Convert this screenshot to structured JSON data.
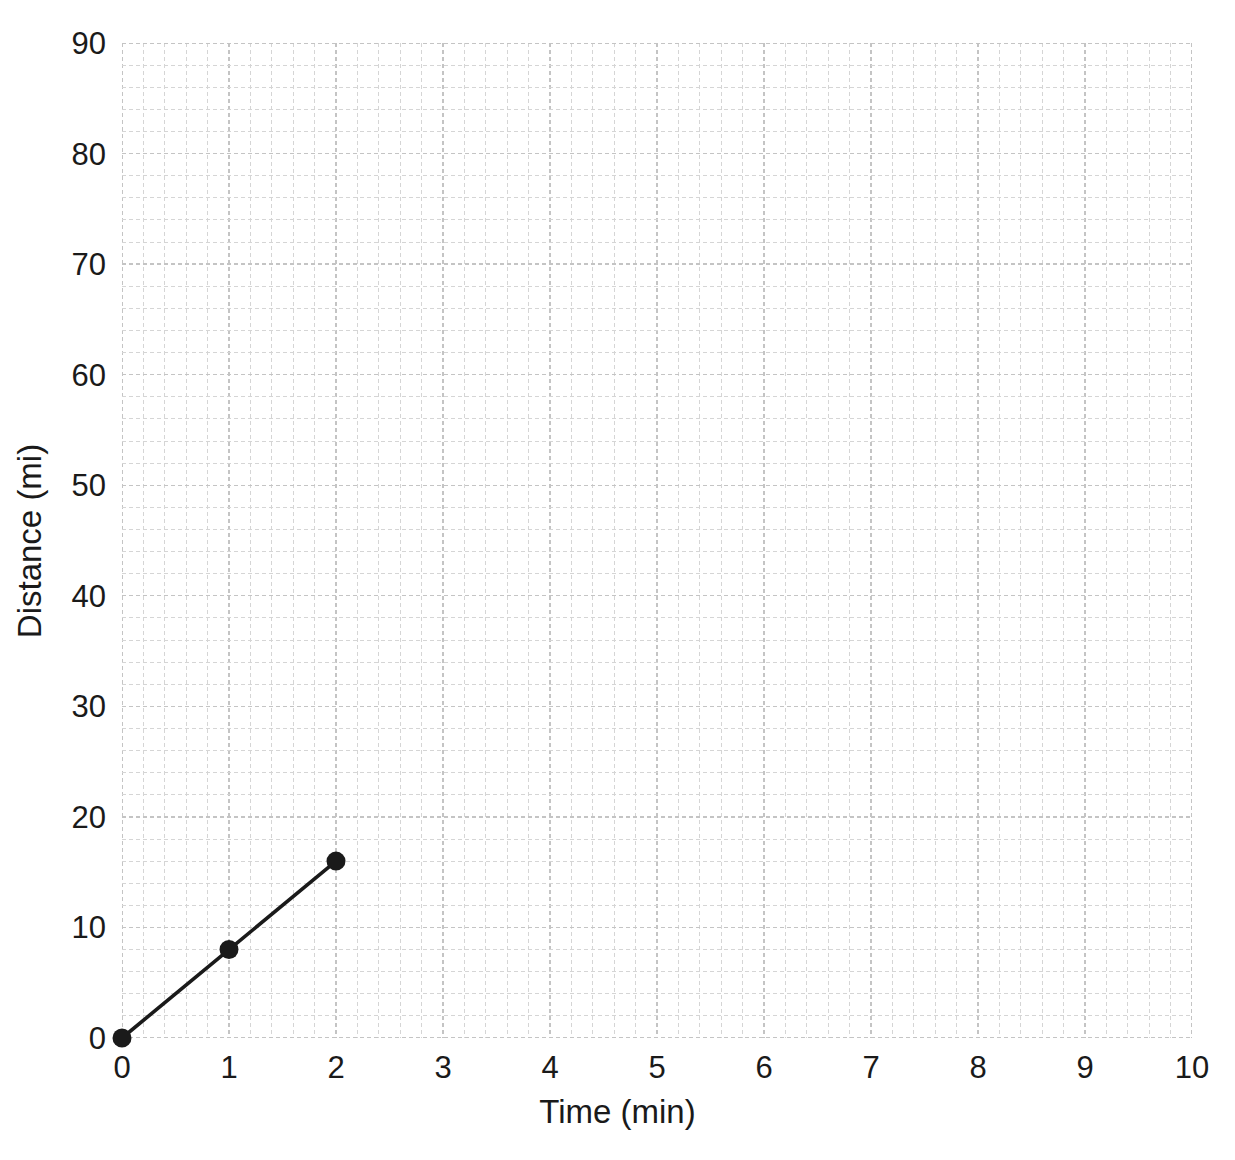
{
  "chart_data": {
    "type": "line",
    "title": "",
    "xlabel": "Time (min)",
    "ylabel": "Distance (mi)",
    "xlim": [
      0,
      10
    ],
    "ylim": [
      0,
      90
    ],
    "xticks": [
      0,
      1,
      2,
      3,
      4,
      5,
      6,
      7,
      8,
      9,
      10
    ],
    "yticks": [
      0,
      10,
      20,
      30,
      40,
      50,
      60,
      70,
      80,
      90
    ],
    "xtick_labels": [
      "0",
      "1",
      "2",
      "3",
      "4",
      "5",
      "6",
      "7",
      "8",
      "9",
      "10"
    ],
    "ytick_labels": [
      "0",
      "10",
      "20",
      "30",
      "40",
      "50",
      "60",
      "70",
      "80",
      "90"
    ],
    "x_minor_step": 0.2,
    "y_minor_step": 2,
    "grid": true,
    "grid_style": "dashed",
    "grid_color": "#d5d5d5",
    "grid_major_color": "#c4c4c4",
    "legend": null,
    "series": [
      {
        "name": "Distance",
        "color": "#1a1a1a",
        "marker": "circle",
        "x": [
          0,
          1,
          2
        ],
        "y": [
          0,
          8,
          16
        ],
        "points": [
          {
            "x": 0,
            "y": 0
          },
          {
            "x": 1,
            "y": 8
          },
          {
            "x": 2,
            "y": 16
          }
        ]
      }
    ]
  },
  "axes": {
    "x_title": "Time (min)",
    "y_title": "Distance (mi)"
  }
}
